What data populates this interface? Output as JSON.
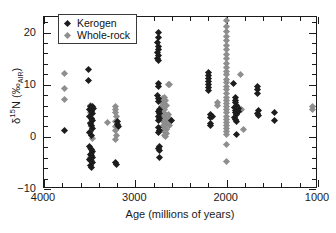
{
  "chart_data": {
    "type": "scatter",
    "title": "",
    "xlabel": "Age (millions of years)",
    "ylabel_parts": {
      "delta": "δ",
      "mass": "15",
      "element": "N",
      "open_paren": " (",
      "permil": "‰",
      "subscript": "AIR",
      "close_paren": ")"
    },
    "ylabel_plain": "δ15N (‰AIR)",
    "xlim": [
      4000,
      1000
    ],
    "ylim": [
      -10,
      23
    ],
    "x_inverted": true,
    "grid": false,
    "x_ticks": [
      4000,
      3000,
      2000,
      1000
    ],
    "x_tick_labels": [
      "4000",
      "3000",
      "2000",
      "1000"
    ],
    "x_minor_interval": 200,
    "y_ticks": [
      -10,
      0,
      10,
      20
    ],
    "y_tick_labels": [
      "−10",
      "0",
      "10",
      "20"
    ],
    "y_minor_interval": 2,
    "legend_position": "top-left",
    "series": [
      {
        "name": "Kerogen",
        "color": "#1c1c1c",
        "marker": "diamond",
        "points": [
          [
            3780,
            1.2
          ],
          [
            3510,
            13.0
          ],
          [
            3510,
            10.8
          ],
          [
            3490,
            5.9
          ],
          [
            3470,
            5.9
          ],
          [
            3455,
            5.5
          ],
          [
            3500,
            5.2
          ],
          [
            3480,
            4.8
          ],
          [
            3465,
            4.4
          ],
          [
            3500,
            4.0
          ],
          [
            3485,
            3.6
          ],
          [
            3470,
            3.1
          ],
          [
            3495,
            2.6
          ],
          [
            3480,
            2.1
          ],
          [
            3465,
            1.6
          ],
          [
            3500,
            0.9
          ],
          [
            3485,
            0.3
          ],
          [
            3500,
            -1.9
          ],
          [
            3485,
            -2.4
          ],
          [
            3470,
            -2.9
          ],
          [
            3495,
            -3.3
          ],
          [
            3480,
            -3.6
          ],
          [
            3465,
            -3.9
          ],
          [
            3500,
            -4.3
          ],
          [
            3487,
            -4.6
          ],
          [
            3472,
            -5.0
          ],
          [
            3495,
            -5.4
          ],
          [
            3480,
            -5.8
          ],
          [
            3215,
            -5.0
          ],
          [
            3205,
            -5.3
          ],
          [
            3190,
            2.9
          ],
          [
            3195,
            2.4
          ],
          [
            3185,
            1.9
          ],
          [
            2750,
            20.0
          ],
          [
            2748,
            19.0
          ],
          [
            2752,
            18.2
          ],
          [
            2745,
            17.4
          ],
          [
            2750,
            16.8
          ],
          [
            2755,
            16.2
          ],
          [
            2747,
            15.6
          ],
          [
            2752,
            15.1
          ],
          [
            2745,
            14.6
          ],
          [
            2745,
            10.2
          ],
          [
            2750,
            9.6
          ],
          [
            2752,
            7.9
          ],
          [
            2745,
            7.3
          ],
          [
            2748,
            6.8
          ],
          [
            2740,
            5.2
          ],
          [
            2748,
            4.8
          ],
          [
            2735,
            4.4
          ],
          [
            2745,
            4.0
          ],
          [
            2738,
            3.5
          ],
          [
            2750,
            3.1
          ],
          [
            2742,
            1.8
          ],
          [
            2735,
            1.3
          ],
          [
            2748,
            0.9
          ],
          [
            2738,
            -1.9
          ],
          [
            2745,
            -2.3
          ],
          [
            2735,
            -2.7
          ],
          [
            2740,
            -4.0
          ],
          [
            2600,
            3.1
          ],
          [
            2200,
            12.3
          ],
          [
            2198,
            11.7
          ],
          [
            2202,
            11.2
          ],
          [
            2196,
            10.7
          ],
          [
            2200,
            10.1
          ],
          [
            2203,
            9.5
          ],
          [
            2197,
            8.9
          ],
          [
            2180,
            4.2
          ],
          [
            2178,
            3.7
          ],
          [
            2182,
            2.6
          ],
          [
            2176,
            2.1
          ],
          [
            2150,
            4.0
          ],
          [
            1930,
            10.2
          ],
          [
            1905,
            7.5
          ],
          [
            1900,
            7.0
          ],
          [
            1908,
            6.6
          ],
          [
            1896,
            6.1
          ],
          [
            1910,
            5.6
          ],
          [
            1898,
            5.1
          ],
          [
            1905,
            4.7
          ],
          [
            1893,
            4.2
          ],
          [
            1912,
            3.8
          ],
          [
            1900,
            3.3
          ],
          [
            1888,
            2.9
          ],
          [
            1875,
            5.4
          ],
          [
            1870,
            4.9
          ],
          [
            1895,
            0.4
          ],
          [
            1660,
            9.6
          ],
          [
            1665,
            9.0
          ],
          [
            1658,
            8.4
          ],
          [
            1655,
            5.0
          ],
          [
            1660,
            4.5
          ],
          [
            1650,
            4.1
          ],
          [
            1480,
            4.7
          ],
          [
            1478,
            3.1
          ]
        ]
      },
      {
        "name": "Whole-rock",
        "color": "#8e8e8e",
        "marker": "diamond",
        "points": [
          [
            3780,
            12.1
          ],
          [
            3780,
            9.3
          ],
          [
            3780,
            7.1
          ],
          [
            3495,
            6.0
          ],
          [
            3480,
            5.3
          ],
          [
            3490,
            4.6
          ],
          [
            3478,
            3.6
          ],
          [
            3492,
            2.8
          ],
          [
            3480,
            1.9
          ],
          [
            3486,
            1.0
          ],
          [
            3474,
            -0.3
          ],
          [
            3488,
            -2.3
          ],
          [
            3476,
            -3.2
          ],
          [
            3492,
            -3.9
          ],
          [
            3480,
            -4.5
          ],
          [
            3300,
            2.7
          ],
          [
            3220,
            5.9
          ],
          [
            3215,
            5.3
          ],
          [
            3222,
            4.6
          ],
          [
            3210,
            3.9
          ],
          [
            3218,
            2.9
          ],
          [
            3212,
            2.0
          ],
          [
            3220,
            1.2
          ],
          [
            3208,
            0.3
          ],
          [
            3216,
            -0.5
          ],
          [
            2640,
            10.1
          ],
          [
            2630,
            10.1
          ],
          [
            2680,
            7.6
          ],
          [
            2670,
            7.0
          ],
          [
            2690,
            6.5
          ],
          [
            2660,
            6.1
          ],
          [
            2700,
            7.3
          ],
          [
            2690,
            6.9
          ],
          [
            2710,
            5.9
          ],
          [
            2695,
            5.5
          ],
          [
            2680,
            5.2
          ],
          [
            2705,
            4.9
          ],
          [
            2688,
            4.6
          ],
          [
            2672,
            4.3
          ],
          [
            2700,
            4.0
          ],
          [
            2685,
            3.7
          ],
          [
            2668,
            3.4
          ],
          [
            2698,
            3.1
          ],
          [
            2682,
            2.8
          ],
          [
            2665,
            2.5
          ],
          [
            2695,
            2.1
          ],
          [
            2678,
            1.8
          ],
          [
            2662,
            1.5
          ],
          [
            2690,
            1.2
          ],
          [
            2674,
            0.9
          ],
          [
            2658,
            0.6
          ],
          [
            2686,
            0.3
          ],
          [
            2670,
            0.1
          ],
          [
            2640,
            4.2
          ],
          [
            2625,
            3.5
          ],
          [
            2645,
            2.9
          ],
          [
            2630,
            2.2
          ],
          [
            2100,
            6.6
          ],
          [
            2098,
            6.0
          ],
          [
            2000,
            22.3
          ],
          [
            2000,
            21.1
          ],
          [
            2002,
            20.3
          ],
          [
            1998,
            19.3
          ],
          [
            2000,
            18.4
          ],
          [
            2001,
            17.5
          ],
          [
            1999,
            16.7
          ],
          [
            2000,
            15.8
          ],
          [
            2002,
            15.0
          ],
          [
            1998,
            14.1
          ],
          [
            2000,
            13.3
          ],
          [
            2001,
            12.6
          ],
          [
            1999,
            11.9
          ],
          [
            2000,
            11.1
          ],
          [
            2002,
            10.4
          ],
          [
            1998,
            9.7
          ],
          [
            2000,
            9.0
          ],
          [
            2001,
            8.3
          ],
          [
            1999,
            7.6
          ],
          [
            2000,
            7.0
          ],
          [
            2002,
            6.4
          ],
          [
            1998,
            5.8
          ],
          [
            2000,
            5.2
          ],
          [
            2001,
            4.6
          ],
          [
            1999,
            4.0
          ],
          [
            2000,
            3.4
          ],
          [
            2002,
            2.8
          ],
          [
            1998,
            2.2
          ],
          [
            2000,
            1.6
          ],
          [
            2001,
            1.0
          ],
          [
            1999,
            0.4
          ],
          [
            2000,
            -1.5
          ],
          [
            2000,
            -4.7
          ],
          [
            1850,
            11.9
          ],
          [
            1880,
            5.8
          ],
          [
            1872,
            5.3
          ],
          [
            1866,
            4.9
          ],
          [
            1840,
            5.3
          ],
          [
            1820,
            1.4
          ],
          [
            1060,
            5.9
          ],
          [
            1060,
            5.2
          ]
        ]
      }
    ]
  },
  "legend": {
    "items": [
      {
        "label": "Kerogen",
        "color": "#1c1c1c"
      },
      {
        "label": "Whole-rock",
        "color": "#8e8e8e"
      }
    ]
  },
  "axes": {
    "x_title": "Age (millions of years)",
    "x_tick_labels": [
      "4000",
      "3000",
      "2000",
      "1000"
    ],
    "y_tick_labels": [
      "−10",
      "0",
      "10",
      "20"
    ]
  }
}
